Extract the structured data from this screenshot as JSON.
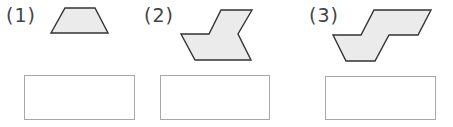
{
  "problems": [
    {
      "label": "(1)",
      "shape": "trapezoid",
      "answer": ""
    },
    {
      "label": "(2)",
      "shape": "hexagon-arrow",
      "answer": ""
    },
    {
      "label": "(3)",
      "shape": "octagon-z",
      "answer": ""
    }
  ],
  "colors": {
    "fill": "#ebebeb",
    "stroke": "#333333",
    "box_border": "#a8a8a8"
  }
}
